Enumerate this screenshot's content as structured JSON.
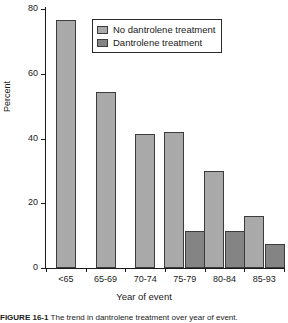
{
  "chart_data": {
    "type": "bar",
    "title": "",
    "xlabel": "Year of event",
    "ylabel": "Percent",
    "categories": [
      "<65",
      "65-69",
      "70-74",
      "75-79",
      "80-84",
      "85-93"
    ],
    "series": [
      {
        "name": "No dantrolene treatment",
        "color": "#a9a9a9",
        "values": [
          76.5,
          54.5,
          41.5,
          42,
          30,
          16
        ]
      },
      {
        "name": "Dantrolene treatment",
        "color": "#848484",
        "values": [
          null,
          null,
          null,
          11.5,
          11.5,
          7.5
        ]
      }
    ],
    "ylim": [
      0,
      80
    ],
    "yticks": [
      0,
      20,
      40,
      60,
      80
    ],
    "ytick_labels": [
      "0",
      "20",
      "40",
      "60",
      "80"
    ],
    "grid": false,
    "legend_position": "top-center"
  },
  "legend": {
    "items": [
      {
        "label": "No dantrolene treatment",
        "swatch": "series-0"
      },
      {
        "label": "Dantrolene treatment",
        "swatch": "series-1"
      }
    ]
  },
  "caption": {
    "prefix": "FIGURE 16-1",
    "text": "The trend in dantrolene treatment over year of event."
  }
}
